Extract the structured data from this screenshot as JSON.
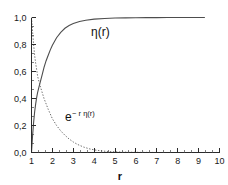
{
  "chart_data": {
    "type": "line",
    "title": "",
    "subtitle": "",
    "xlabel": "r",
    "ylabel": "",
    "xlim": [
      1,
      10
    ],
    "ylim": [
      0.0,
      1.0
    ],
    "grid": false,
    "legend_position": "inline-annotations",
    "x_ticks": [
      "1",
      "2",
      "3",
      "4",
      "5",
      "6",
      "7",
      "8",
      "9",
      "10"
    ],
    "x_tick_values": [
      1,
      2,
      3,
      4,
      5,
      6,
      7,
      8,
      9,
      10
    ],
    "x_minor_ticks_per_interval": 2,
    "y_ticks": [
      "0,0",
      "0,2",
      "0,4",
      "0,6",
      "0,8",
      "1,0"
    ],
    "y_tick_values": [
      0.0,
      0.2,
      0.4,
      0.6,
      0.8,
      1.0
    ],
    "y_minor_ticks_per_interval": 2,
    "annotations": [
      {
        "id": "eta-label",
        "text": "η(r)",
        "x": 4.3,
        "y": 0.86
      },
      {
        "id": "exp-label",
        "text_base": "e",
        "text_sup": "− r η(r)",
        "x": 2.6,
        "y": 0.23
      }
    ],
    "series": [
      {
        "name": "η(r)",
        "style": "solid",
        "color": "#4d4d4d",
        "x": [
          1.0,
          1.05,
          1.1,
          1.15,
          1.2,
          1.25,
          1.3,
          1.35,
          1.4,
          1.5,
          1.6,
          1.7,
          1.8,
          1.9,
          2.0,
          2.2,
          2.4,
          2.6,
          2.8,
          3.0,
          3.3,
          3.6,
          4.0,
          4.5,
          5.0,
          5.5,
          6.0,
          6.5,
          7.0,
          7.5,
          8.0,
          8.5,
          9.0,
          9.3
        ],
        "y": [
          0.0,
          0.12,
          0.22,
          0.3,
          0.36,
          0.41,
          0.45,
          0.48,
          0.51,
          0.57,
          0.63,
          0.68,
          0.72,
          0.76,
          0.795,
          0.85,
          0.89,
          0.92,
          0.94,
          0.955,
          0.97,
          0.98,
          0.988,
          0.993,
          0.996,
          0.997,
          0.998,
          0.999,
          0.999,
          1.0,
          1.0,
          1.0,
          1.0,
          1.0
        ]
      },
      {
        "name": "e^{-r η(r)}",
        "style": "dotted",
        "color": "#6e6e6e",
        "x": [
          1.0,
          1.05,
          1.1,
          1.15,
          1.2,
          1.3,
          1.4,
          1.5,
          1.6,
          1.7,
          1.8,
          1.9,
          2.0,
          2.2,
          2.4,
          2.6,
          2.8,
          3.0,
          3.2,
          3.5,
          3.8,
          4.1,
          4.4,
          4.7,
          5.0,
          5.4,
          5.8,
          6.2,
          6.6,
          7.0
        ],
        "y": [
          1.0,
          0.9,
          0.8,
          0.72,
          0.66,
          0.56,
          0.5,
          0.45,
          0.4,
          0.36,
          0.32,
          0.285,
          0.25,
          0.2,
          0.16,
          0.128,
          0.1,
          0.078,
          0.06,
          0.04,
          0.026,
          0.017,
          0.011,
          0.007,
          0.005,
          0.003,
          0.002,
          0.001,
          0.001,
          0.0
        ]
      }
    ]
  },
  "colors": {
    "background": "#ffffff",
    "axis": "#2b2b2b",
    "text": "#111111",
    "series_solid": "#4d4d4d",
    "series_dotted": "#6e6e6e"
  }
}
